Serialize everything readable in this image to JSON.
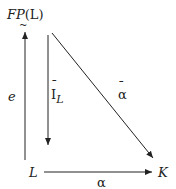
{
  "diagram": {
    "nodes": {
      "top_left": {
        "main": "FP",
        "arg": "(L)",
        "decoration": "~"
      },
      "bottom_left": "L",
      "bottom_right": "K"
    },
    "arrows": {
      "left_vertical": {
        "label": "e",
        "from": "L",
        "to": "FP(L)"
      },
      "inner_vertical": {
        "label_main": "I",
        "label_sub": "L",
        "bar": "¯",
        "from": "FP(L)",
        "to": "L"
      },
      "diagonal": {
        "label": "α",
        "bar": "¯",
        "from": "FP(L)",
        "to": "K"
      },
      "horizontal": {
        "label": "α",
        "from": "L",
        "to": "K"
      }
    },
    "stroke_color": "#222222"
  }
}
